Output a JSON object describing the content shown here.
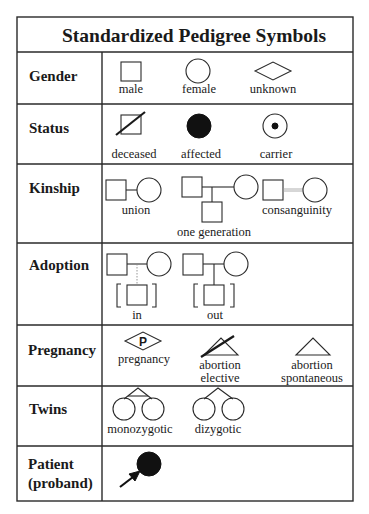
{
  "title": "Standardized Pedigree Symbols",
  "rows": {
    "gender": {
      "label": "Gender",
      "symbols": {
        "male": "male",
        "female": "female",
        "unknown": "unknown"
      }
    },
    "status": {
      "label": "Status",
      "symbols": {
        "deceased": "deceased",
        "affected": "affected",
        "carrier": "carrier"
      }
    },
    "kinship": {
      "label": "Kinship",
      "symbols": {
        "union": "union",
        "one_generation": "one generation",
        "consanguinity": "consanguinity"
      }
    },
    "adoption": {
      "label": "Adoption",
      "symbols": {
        "in": "in",
        "out": "out"
      }
    },
    "pregnancy": {
      "label": "Pregnancy",
      "symbols": {
        "pregnancy": "pregnancy",
        "pregnancy_mark": "P",
        "abortion_elective_1": "abortion",
        "abortion_elective_2": "elective",
        "abortion_spontaneous_1": "abortion",
        "abortion_spontaneous_2": "spontaneous"
      }
    },
    "twins": {
      "label": "Twins",
      "symbols": {
        "monozygotic": "monozygotic",
        "dizygotic": "dizygotic"
      }
    },
    "patient": {
      "label_1": "Patient",
      "label_2": "(proband)"
    }
  },
  "colors": {
    "line": "#2a2a2a",
    "fill": "#111111",
    "background": "#ffffff",
    "consanguinity_line": "#9a9a9a"
  }
}
